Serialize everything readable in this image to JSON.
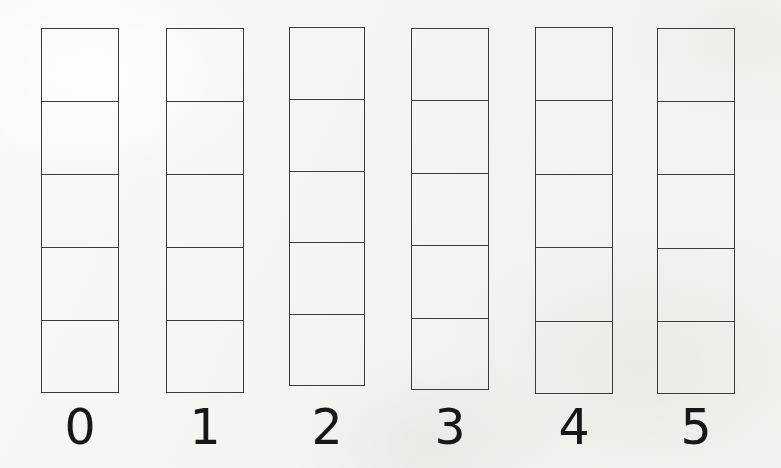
{
  "figure": {
    "title": "",
    "background_color": "#f7f6f3",
    "ink_color": "#3b3b3b",
    "label_color": "#171717"
  },
  "chart_data": {
    "type": "bar",
    "title": "",
    "xlabel": "",
    "ylabel": "",
    "grid": false,
    "legend": null,
    "categories": [
      "0",
      "1",
      "2",
      "3",
      "4",
      "5"
    ],
    "values": [
      5,
      5,
      5,
      5,
      5,
      5
    ],
    "ylim": [
      0,
      5
    ],
    "unit": "cells"
  },
  "columns": [
    {
      "label": "0",
      "cell_count": 5,
      "x": 41,
      "width": 78,
      "top": 28,
      "bottom": 393,
      "label_x": 41,
      "label_y": 403
    },
    {
      "label": "1",
      "cell_count": 5,
      "x": 166,
      "width": 78,
      "top": 28,
      "bottom": 393,
      "label_x": 166,
      "label_y": 403
    },
    {
      "label": "2",
      "cell_count": 5,
      "x": 289,
      "width": 76,
      "top": 27,
      "bottom": 386,
      "label_x": 289,
      "label_y": 403
    },
    {
      "label": "3",
      "cell_count": 5,
      "x": 411,
      "width": 78,
      "top": 28,
      "bottom": 390,
      "label_x": 411,
      "label_y": 403
    },
    {
      "label": "4",
      "cell_count": 5,
      "x": 535,
      "width": 78,
      "top": 27,
      "bottom": 394,
      "label_x": 535,
      "label_y": 403
    },
    {
      "label": "5",
      "cell_count": 5,
      "x": 657,
      "width": 78,
      "top": 28,
      "bottom": 394,
      "label_x": 657,
      "label_y": 403
    }
  ]
}
